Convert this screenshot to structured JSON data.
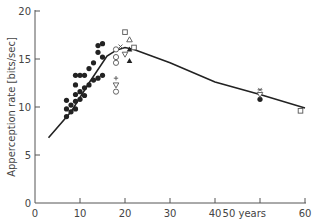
{
  "chart_data": {
    "type": "scatter",
    "title": "",
    "xlabel": "years",
    "ylabel": "Apperception rate  [bits/sec]",
    "xlim": [
      0,
      60
    ],
    "ylim": [
      0,
      20
    ],
    "xticks": [
      0,
      10,
      20,
      30,
      40,
      50,
      60
    ],
    "xtick_labels": [
      "0",
      "10",
      "20",
      "30",
      "40",
      "50 years",
      "60"
    ],
    "yticks": [
      0,
      5,
      10,
      15,
      20
    ],
    "ytick_labels": [
      "0",
      "5",
      "10",
      "15",
      "20"
    ],
    "grid": false,
    "legend": "none",
    "series": [
      {
        "name": "filled-circle",
        "marker": "circle-filled",
        "points": [
          [
            7,
            9.0
          ],
          [
            7,
            9.8
          ],
          [
            7,
            10.7
          ],
          [
            8,
            9.5
          ],
          [
            8,
            10.2
          ],
          [
            9,
            9.8
          ],
          [
            9,
            10.6
          ],
          [
            9,
            11.3
          ],
          [
            9,
            12.3
          ],
          [
            9,
            13.3
          ],
          [
            10,
            10.8
          ],
          [
            10,
            11.6
          ],
          [
            10,
            13.3
          ],
          [
            11,
            11.2
          ],
          [
            11,
            12.0
          ],
          [
            11,
            13.3
          ],
          [
            12,
            12.3
          ],
          [
            12,
            14.0
          ],
          [
            13,
            12.8
          ],
          [
            13,
            14.6
          ],
          [
            14,
            13.0
          ],
          [
            14,
            15.7
          ],
          [
            14,
            16.4
          ],
          [
            15,
            13.3
          ],
          [
            15,
            15.2
          ],
          [
            15,
            16.6
          ],
          [
            50,
            10.8
          ]
        ]
      },
      {
        "name": "open-circle",
        "marker": "circle-open",
        "points": [
          [
            18,
            16.0
          ],
          [
            18,
            15.2
          ],
          [
            18,
            14.6
          ],
          [
            18,
            11.6
          ]
        ]
      },
      {
        "name": "open-square",
        "marker": "square-open",
        "points": [
          [
            20,
            17.8
          ],
          [
            22,
            16.2
          ],
          [
            59,
            9.6
          ]
        ]
      },
      {
        "name": "open-triangle-up",
        "marker": "triangle-up-open",
        "points": [
          [
            21,
            17.0
          ]
        ]
      },
      {
        "name": "filled-triangle-up",
        "marker": "triangle-up-filled",
        "points": [
          [
            21,
            16.0
          ],
          [
            21,
            14.8
          ]
        ]
      },
      {
        "name": "open-triangle-down",
        "marker": "triangle-down-open",
        "points": [
          [
            20,
            15.5
          ],
          [
            18,
            12.3
          ],
          [
            50,
            11.3
          ]
        ]
      },
      {
        "name": "cross",
        "marker": "x",
        "points": [
          [
            19,
            16.3
          ]
        ]
      },
      {
        "name": "plus",
        "marker": "plus",
        "points": [
          [
            18,
            13.0
          ]
        ]
      },
      {
        "name": "asterisk",
        "marker": "asterisk",
        "points": [
          [
            50,
            11.8
          ]
        ]
      },
      {
        "name": "trend-curve",
        "marker": "line",
        "points": [
          [
            3,
            6.8
          ],
          [
            8,
            9.5
          ],
          [
            12,
            12.5
          ],
          [
            16,
            15.3
          ],
          [
            18,
            15.9
          ],
          [
            20,
            16.2
          ],
          [
            22,
            16.0
          ],
          [
            30,
            14.6
          ],
          [
            40,
            12.6
          ],
          [
            50,
            11.3
          ],
          [
            60,
            9.9
          ]
        ]
      }
    ]
  }
}
